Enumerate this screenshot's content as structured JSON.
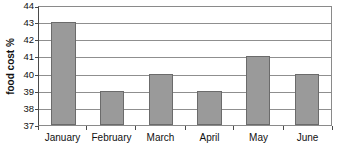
{
  "chart_data": {
    "type": "bar",
    "title": "",
    "subtitle": "",
    "xlabel": "",
    "ylabel": "food cost %",
    "categories": [
      "January",
      "February",
      "March",
      "April",
      "May",
      "June"
    ],
    "values": [
      43,
      39,
      40,
      39,
      41,
      40
    ],
    "ylim": [
      37,
      44
    ],
    "ytick_labels": [
      "44",
      "43",
      "42",
      "41",
      "40",
      "39",
      "38",
      "37"
    ],
    "ytick_values": [
      44,
      43,
      42,
      41,
      40,
      39,
      38,
      37
    ],
    "grid": true,
    "legend": false,
    "legend_position": "none",
    "annotations": [],
    "colors": {
      "bar_fill": "#9a9a9a",
      "bar_border": "#6b6b6b",
      "gridline": "#8f8f8f",
      "axis": "#4a4a4a",
      "plot_background": "#ffffff",
      "text": "#111111"
    }
  }
}
